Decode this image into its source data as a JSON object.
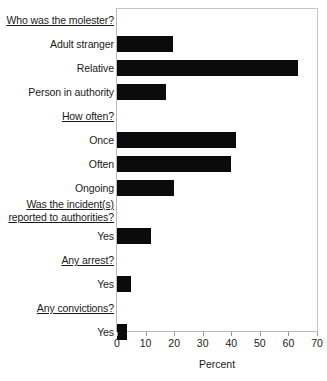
{
  "chart_data": {
    "type": "bar",
    "orientation": "horizontal",
    "title": "",
    "subtitle": "",
    "xlabel": "Percent",
    "ylabel": "",
    "xlim": [
      0,
      70
    ],
    "xticks": [
      0,
      10,
      20,
      30,
      40,
      50,
      60,
      70
    ],
    "xtick_labels": [
      "0",
      "10",
      "20",
      "30",
      "40",
      "50",
      "60",
      "70"
    ],
    "grid": false,
    "legend": null,
    "bar_color": "#0b0b0b",
    "frame_color": "#b9b9b9",
    "sections": [
      {
        "header": "Who was the molester?",
        "header_lines": [
          "Who was the molester?"
        ],
        "categories": [
          "Adult stranger",
          "Relative",
          "Person in authority"
        ],
        "values": [
          19.5,
          63.5,
          17
        ]
      },
      {
        "header": "How often?",
        "header_lines": [
          "How often?"
        ],
        "categories": [
          "Once",
          "Often",
          "Ongoing"
        ],
        "values": [
          41.5,
          40,
          20
        ]
      },
      {
        "header": "Was the incident(s) reported to authorities?",
        "header_lines": [
          "Was the incident(s)",
          "reported to authorities?"
        ],
        "categories": [
          "Yes"
        ],
        "values": [
          12
        ]
      },
      {
        "header": "Any arrest?",
        "header_lines": [
          "Any arrest?"
        ],
        "categories": [
          "Yes"
        ],
        "values": [
          5
        ]
      },
      {
        "header": "Any convictions?",
        "header_lines": [
          "Any convictions?"
        ],
        "categories": [
          "Yes"
        ],
        "values": [
          3.5
        ]
      }
    ],
    "rows": [
      {
        "label": "Who was the molester?",
        "type": "header",
        "value": null
      },
      {
        "label": "Adult stranger",
        "type": "bar",
        "value": 19.5
      },
      {
        "label": "Relative",
        "type": "bar",
        "value": 63.5
      },
      {
        "label": "Person in authority",
        "type": "bar",
        "value": 17
      },
      {
        "label": "How often?",
        "type": "header",
        "value": null
      },
      {
        "label": "Once",
        "type": "bar",
        "value": 41.5
      },
      {
        "label": "Often",
        "type": "bar",
        "value": 40
      },
      {
        "label": "Ongoing",
        "type": "bar",
        "value": 20
      },
      {
        "label": "Was the incident(s) reported to authorities?",
        "type": "header",
        "value": null
      },
      {
        "label": "Yes",
        "type": "bar",
        "value": 12
      },
      {
        "label": "Any arrest?",
        "type": "header",
        "value": null
      },
      {
        "label": "Yes",
        "type": "bar",
        "value": 5
      },
      {
        "label": "Any convictions?",
        "type": "header",
        "value": null
      },
      {
        "label": "Yes",
        "type": "bar",
        "value": 3.5
      }
    ]
  }
}
